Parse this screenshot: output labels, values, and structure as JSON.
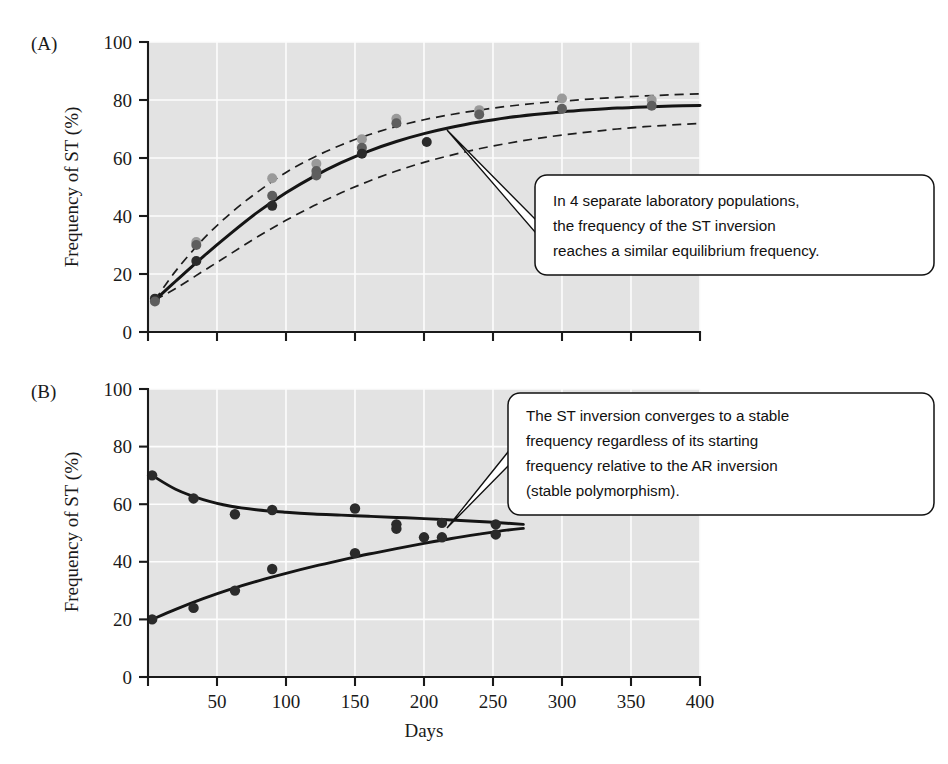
{
  "figure": {
    "panels": [
      {
        "id": "A",
        "label": "(A)",
        "ylabel": "Frequency of ST (%)",
        "xlabel": "",
        "callout": {
          "lines": [
            "In 4 separate laboratory populations,",
            "the frequency of the ST inversion",
            "reaches a similar equilibrium frequency."
          ]
        }
      },
      {
        "id": "B",
        "label": "(B)",
        "ylabel": "Frequency of ST (%)",
        "xlabel": "Days",
        "callout": {
          "lines": [
            "The ST inversion converges to a stable",
            "frequency regardless of its starting",
            "frequency relative to the AR inversion",
            "(stable polymorphism)."
          ]
        }
      }
    ],
    "colors": {
      "plot_background": "#e3e3e3",
      "gridline": "#fdfdfd",
      "axis": "#1a1a1a",
      "curve": "#151515",
      "point_dark": "#2b2b2b",
      "point_mid": "#5e5e5e",
      "point_light": "#9a9a9a",
      "callout_fill": "#ffffff",
      "callout_stroke": "#111111"
    }
  },
  "chart_data": [
    {
      "type": "scatter",
      "panel": "A",
      "title": "",
      "xlabel": "",
      "ylabel": "Frequency of ST (%)",
      "xlim": [
        0,
        400
      ],
      "ylim": [
        0,
        100
      ],
      "xticks": [
        0,
        50,
        100,
        150,
        200,
        250,
        300,
        350,
        400
      ],
      "xticklabels": [
        "",
        "",
        "",
        "",
        "",
        "",
        "",
        "",
        ""
      ],
      "yticks": [
        0,
        20,
        40,
        60,
        80,
        100
      ],
      "yticklabels": [
        "0",
        "20",
        "40",
        "60",
        "80",
        "100"
      ],
      "grid": true,
      "legend": "none",
      "series": [
        {
          "name": "Fitted logistic curve",
          "style": "solid-line",
          "x": [
            5,
            20,
            40,
            60,
            80,
            100,
            120,
            140,
            160,
            180,
            200,
            220,
            240,
            260,
            280,
            300,
            320,
            340,
            360,
            380,
            400
          ],
          "y": [
            11.0,
            17.5,
            26.0,
            34.0,
            41.5,
            48.0,
            53.6,
            58.4,
            62.4,
            65.7,
            68.4,
            70.6,
            72.4,
            73.9,
            75.0,
            75.9,
            76.6,
            77.2,
            77.6,
            77.9,
            78.1
          ]
        },
        {
          "name": "Upper confidence band",
          "style": "dashed-line",
          "x": [
            5,
            20,
            40,
            60,
            80,
            100,
            120,
            140,
            160,
            180,
            200,
            220,
            240,
            260,
            280,
            300,
            320,
            340,
            360,
            380,
            400
          ],
          "y": [
            11.0,
            21.0,
            32.0,
            41.0,
            48.5,
            55.0,
            60.2,
            64.5,
            68.0,
            70.9,
            73.2,
            75.0,
            76.5,
            77.8,
            78.8,
            79.6,
            80.3,
            80.9,
            81.4,
            81.8,
            82.1
          ]
        },
        {
          "name": "Lower confidence band",
          "style": "dashed-line",
          "x": [
            5,
            20,
            40,
            60,
            80,
            100,
            120,
            140,
            160,
            180,
            200,
            220,
            240,
            260,
            280,
            300,
            320,
            340,
            360,
            380,
            400
          ],
          "y": [
            11.0,
            15.0,
            21.0,
            27.0,
            33.0,
            38.5,
            43.5,
            48.0,
            52.0,
            55.5,
            58.5,
            61.0,
            63.2,
            65.0,
            66.6,
            67.9,
            69.0,
            70.0,
            70.8,
            71.4,
            71.9
          ]
        },
        {
          "name": "Population replicate observations",
          "style": "points",
          "points": [
            {
              "x": 5,
              "y": 11.5,
              "shade": "dark"
            },
            {
              "x": 5,
              "y": 10.5,
              "shade": "mid"
            },
            {
              "x": 35,
              "y": 31.0,
              "shade": "light"
            },
            {
              "x": 35,
              "y": 30.0,
              "shade": "mid"
            },
            {
              "x": 35,
              "y": 24.5,
              "shade": "dark"
            },
            {
              "x": 90,
              "y": 53.0,
              "shade": "light"
            },
            {
              "x": 90,
              "y": 47.0,
              "shade": "mid"
            },
            {
              "x": 90,
              "y": 43.5,
              "shade": "dark"
            },
            {
              "x": 122,
              "y": 58.0,
              "shade": "light"
            },
            {
              "x": 122,
              "y": 55.5,
              "shade": "mid"
            },
            {
              "x": 122,
              "y": 54.0,
              "shade": "mid"
            },
            {
              "x": 155,
              "y": 66.5,
              "shade": "light"
            },
            {
              "x": 155,
              "y": 63.5,
              "shade": "mid"
            },
            {
              "x": 155,
              "y": 61.5,
              "shade": "dark"
            },
            {
              "x": 180,
              "y": 73.5,
              "shade": "light"
            },
            {
              "x": 180,
              "y": 72.0,
              "shade": "mid"
            },
            {
              "x": 202,
              "y": 65.5,
              "shade": "dark"
            },
            {
              "x": 240,
              "y": 76.5,
              "shade": "light"
            },
            {
              "x": 240,
              "y": 75.0,
              "shade": "mid"
            },
            {
              "x": 300,
              "y": 80.5,
              "shade": "light"
            },
            {
              "x": 300,
              "y": 77.0,
              "shade": "mid"
            },
            {
              "x": 365,
              "y": 80.0,
              "shade": "light"
            },
            {
              "x": 365,
              "y": 78.0,
              "shade": "mid"
            }
          ]
        }
      ]
    },
    {
      "type": "scatter",
      "panel": "B",
      "title": "",
      "xlabel": "Days",
      "ylabel": "Frequency of ST (%)",
      "xlim": [
        0,
        400
      ],
      "ylim": [
        0,
        100
      ],
      "xticks": [
        0,
        50,
        100,
        150,
        200,
        250,
        300,
        350,
        400
      ],
      "xticklabels": [
        "",
        "50",
        "100",
        "150",
        "200",
        "250",
        "300",
        "350",
        "400"
      ],
      "yticks": [
        0,
        20,
        40,
        60,
        80,
        100
      ],
      "yticklabels": [
        "0",
        "20",
        "40",
        "60",
        "80",
        "100"
      ],
      "grid": true,
      "legend": "none",
      "series": [
        {
          "name": "High starting frequency population (curve)",
          "style": "solid-line",
          "x": [
            3,
            20,
            40,
            60,
            80,
            100,
            120,
            140,
            160,
            180,
            200,
            220,
            240,
            260,
            272
          ],
          "y": [
            70.0,
            65.2,
            61.6,
            59.3,
            58.0,
            57.2,
            56.6,
            56.2,
            55.8,
            55.4,
            55.0,
            54.5,
            54.0,
            53.4,
            53.0
          ]
        },
        {
          "name": "Low starting frequency population (curve)",
          "style": "solid-line",
          "x": [
            3,
            20,
            40,
            60,
            80,
            100,
            120,
            140,
            160,
            180,
            200,
            220,
            240,
            260,
            272
          ],
          "y": [
            20.0,
            23.5,
            27.2,
            30.5,
            33.4,
            36.0,
            38.4,
            40.6,
            42.7,
            44.6,
            46.4,
            48.1,
            49.6,
            51.0,
            51.6
          ]
        },
        {
          "name": "High starting frequency observations",
          "style": "points",
          "points": [
            {
              "x": 3,
              "y": 70.0,
              "shade": "dark"
            },
            {
              "x": 33,
              "y": 62.0,
              "shade": "dark"
            },
            {
              "x": 63,
              "y": 56.5,
              "shade": "dark"
            },
            {
              "x": 90,
              "y": 58.0,
              "shade": "dark"
            },
            {
              "x": 150,
              "y": 58.5,
              "shade": "dark"
            },
            {
              "x": 180,
              "y": 53.0,
              "shade": "dark"
            },
            {
              "x": 180,
              "y": 51.5,
              "shade": "dark"
            },
            {
              "x": 213,
              "y": 53.5,
              "shade": "dark"
            },
            {
              "x": 252,
              "y": 53.0,
              "shade": "dark"
            }
          ]
        },
        {
          "name": "Low starting frequency observations",
          "style": "points",
          "points": [
            {
              "x": 3,
              "y": 20.0,
              "shade": "dark"
            },
            {
              "x": 33,
              "y": 24.0,
              "shade": "dark"
            },
            {
              "x": 63,
              "y": 30.0,
              "shade": "dark"
            },
            {
              "x": 90,
              "y": 37.5,
              "shade": "dark"
            },
            {
              "x": 150,
              "y": 43.0,
              "shade": "dark"
            },
            {
              "x": 200,
              "y": 48.5,
              "shade": "dark"
            },
            {
              "x": 213,
              "y": 48.5,
              "shade": "dark"
            },
            {
              "x": 252,
              "y": 49.5,
              "shade": "dark"
            }
          ]
        }
      ]
    }
  ]
}
